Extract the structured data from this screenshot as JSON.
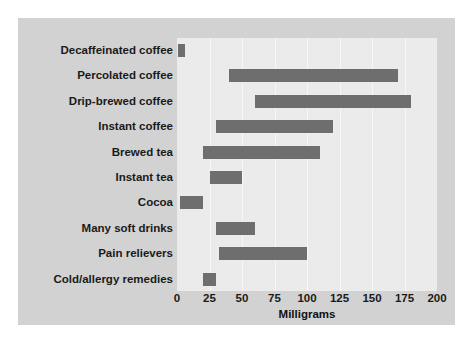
{
  "chart_data": {
    "type": "bar",
    "orientation": "horizontal",
    "bar_style": "range",
    "title": "",
    "subtitle": "",
    "xlabel": "Milligrams",
    "ylabel": "",
    "xlim": [
      0,
      200
    ],
    "xticks": [
      0,
      25,
      50,
      75,
      100,
      125,
      150,
      175,
      200
    ],
    "xtick_labels": [
      "0",
      "25",
      "50",
      "75",
      "100",
      "125",
      "150",
      "175",
      "200"
    ],
    "grid": true,
    "grid_axis": "x",
    "legend": false,
    "categories": [
      "Decaffeinated coffee",
      "Percolated coffee",
      "Drip-brewed coffee",
      "Instant coffee",
      "Brewed tea",
      "Instant tea",
      "Cocoa",
      "Many soft drinks",
      "Pain relievers",
      "Cold/allergy remedies"
    ],
    "ranges": [
      {
        "category": "Decaffeinated coffee",
        "low": 1,
        "high": 6
      },
      {
        "category": "Percolated coffee",
        "low": 40,
        "high": 170
      },
      {
        "category": "Drip-brewed coffee",
        "low": 60,
        "high": 180
      },
      {
        "category": "Instant coffee",
        "low": 30,
        "high": 120
      },
      {
        "category": "Brewed tea",
        "low": 20,
        "high": 110
      },
      {
        "category": "Instant tea",
        "low": 25,
        "high": 50
      },
      {
        "category": "Cocoa",
        "low": 2,
        "high": 20
      },
      {
        "category": "Many soft drinks",
        "low": 30,
        "high": 60
      },
      {
        "category": "Pain relievers",
        "low": 32,
        "high": 100
      },
      {
        "category": "Cold/allergy remedies",
        "low": 20,
        "high": 30
      }
    ]
  },
  "style": {
    "panel_background": "#d2d2d2",
    "plot_background": "#ebebeb",
    "gridline_color": "#f7f7f7",
    "bar_color": "#6e6e6e",
    "text_color": "#1a1a1a",
    "page_background": "#ffffff"
  }
}
